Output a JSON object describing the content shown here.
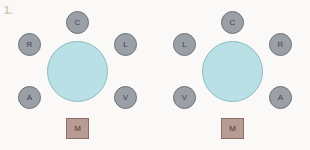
{
  "figure": {
    "number": "1."
  },
  "colors": {
    "background": "#faf9f7",
    "hub_fill": "#b9e1e5",
    "hub_stroke": "#8cbcc2",
    "node_fill": "#9ba0a7",
    "node_stroke": "#6d727a",
    "square_fill": "#b89b93",
    "square_stroke": "#8c6e66",
    "label_text": "#3f4449",
    "figure_number_text": "#c9c8ae"
  },
  "diagrams": [
    {
      "id": "left-diagram",
      "orientation": "standard",
      "hub": {
        "label": ""
      },
      "nodes": [
        {
          "slot": "top",
          "label": "C"
        },
        {
          "slot": "upper-left",
          "label": "R"
        },
        {
          "slot": "upper-right",
          "label": "L"
        },
        {
          "slot": "lower-left",
          "label": "A"
        },
        {
          "slot": "lower-right",
          "label": "V"
        }
      ],
      "square": {
        "label": "M"
      }
    },
    {
      "id": "right-diagram",
      "orientation": "mirrored",
      "hub": {
        "label": ""
      },
      "nodes": [
        {
          "slot": "top",
          "label": "C"
        },
        {
          "slot": "upper-left",
          "label": "L"
        },
        {
          "slot": "upper-right",
          "label": "R"
        },
        {
          "slot": "lower-left",
          "label": "V"
        },
        {
          "slot": "lower-right",
          "label": "A"
        }
      ],
      "square": {
        "label": "M"
      }
    }
  ]
}
